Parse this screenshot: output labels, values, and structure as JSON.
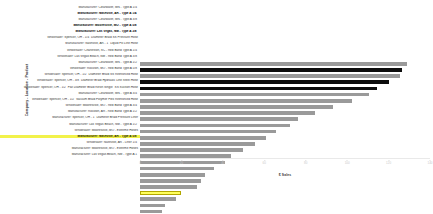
{
  "chart_data": {
    "type": "bar",
    "orientation": "horizontal",
    "title": "",
    "xlabel": "$ Sales",
    "ylabel": "Company - Location - Product",
    "xlim": [
      0,
      140
    ],
    "grid": false,
    "legend": null,
    "xticks": [
      "0",
      "20",
      "40",
      "60",
      "80",
      "100",
      "120",
      "140"
    ],
    "xtick_values": [
      0,
      20,
      40,
      60,
      80,
      100,
      120,
      140
    ],
    "categories": [
      "Manufacturer: Clearwater, MN - Type A 1/4\"",
      "Manufacturer: Nashville, AR - Type A 1/4\"",
      "Manufacturer: Clearwater, MN - Type A 3/8\"",
      "Manufacturer: Mooresville, MO - Type A 5/8\"",
      "Manufacturer: Las Vegas, NM - Type A 3/8\"",
      "Wholesaler: Spencer, OH - 1/4\" Diameter Braid SS Pressure Hose",
      "Manufacturer: Nashville, AR - 1\" Liquid Fill Line Hose",
      "Wholesaler: Charleston, SC - Red Band Type A 1/4\"",
      "Wholesaler: Las Vegas Beach, NM - Red Band Type A 3/8\"",
      "Manufacturer: Clearwater, MN - Type A 1/2\"",
      "Wholesaler: Rockton, MO - Red Band Type A 5/8\"",
      "Wholesaler: Spencer, OH - 1/2\" Diameter Braid SS Reinforced Hose",
      "Wholesaler: Spencer, OH - 3/8\" Diameter Braid Hydraulic Line Steel Hose",
      "Wholesaler: Spencer, OH - 1/2\" Flat Diameter Braid Resin Single\" SS Suction Hose",
      "Manufacturer: Clearwater, MN - Type A 3/4\"",
      "Wholesaler: Spencer, OH - 1/2\" Vacuum Braid Polymer Flex Reinforced Hose",
      "Wholesaler: Mooresville, MO - Red Band Type A 3/4\"",
      "Manufacturer: Rockton, AR - Red Band Type A 1/2\"",
      "Manufacturer: Spencer, OH - 1\" Diameter Braid Pressure Liner",
      "Manufacturer: Las Vegas Beach, NM - Type A 1/2\"",
      "Wholesaler: Mooresville, MO - Extreme Hoses",
      "Manufacturer: Nashville, AR - Type A 5/8\"",
      "Wholesaler: Nashville, AR - Liner 1/4\"",
      "Manufacturer: Mooresville, MO - Extreme Hoses",
      "Manufacturer: Las Vegas Beach, NM - Type A 1\""
    ],
    "values": [
      129.0,
      126.5,
      125.5,
      120.0,
      114.5,
      110.5,
      102.5,
      93.0,
      84.5,
      76.5,
      72.5,
      65.5,
      61.0,
      55.5,
      49.5,
      44.0,
      41.0,
      35.5,
      31.5,
      29.5,
      27.5,
      20.0,
      17.5,
      12.0,
      10.5
    ],
    "bar_styles": [
      "normal",
      "emphasis",
      "normal",
      "emphasis",
      "emphasis",
      "normal",
      "normal",
      "normal",
      "normal",
      "normal",
      "normal",
      "normal",
      "normal",
      "normal",
      "normal",
      "normal",
      "normal",
      "normal",
      "normal",
      "normal",
      "normal",
      "highlight",
      "normal",
      "normal",
      "normal"
    ],
    "colors": {
      "bar": "#9a9a9a",
      "bar_emphasis": "#0d0d0d",
      "bar_highlight_fill": "#ffff5c",
      "bar_highlight_border": "#b3a800",
      "label_highlight_bg": "#f2f24a",
      "axis_text": "#c9c9c9",
      "background": "#ffffff"
    }
  }
}
